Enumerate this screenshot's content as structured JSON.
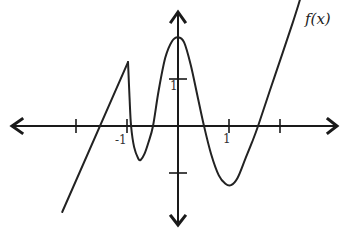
{
  "chart_data": {
    "type": "line",
    "title": "",
    "xlabel": "",
    "ylabel": "",
    "function_label": "f(x)",
    "xlim": [
      -3.3,
      3.1
    ],
    "ylim": [
      -2.1,
      2.5
    ],
    "grid": false,
    "x_ticks": [
      -2,
      -1,
      1,
      2
    ],
    "y_ticks": [
      -1,
      1
    ],
    "x_tick_labels": [
      {
        "value": -1,
        "text": "-1"
      },
      {
        "value": 1,
        "text": "1"
      }
    ],
    "y_tick_labels": [
      {
        "value": 1,
        "text": "1"
      }
    ],
    "series": [
      {
        "name": "f(x)",
        "segments": [
          {
            "kind": "line",
            "points": [
              [
                -2.27,
                -1.83
              ],
              [
                -0.98,
                1.36
              ]
            ]
          },
          {
            "kind": "curve",
            "points": [
              [
                -0.98,
                1.36
              ],
              [
                -0.95,
                0.6
              ],
              [
                -0.92,
                0.0
              ],
              [
                -0.86,
                -0.45
              ],
              [
                -0.78,
                -0.69
              ],
              [
                -0.73,
                -0.72
              ],
              [
                -0.66,
                -0.6
              ],
              [
                -0.58,
                -0.35
              ],
              [
                -0.49,
                0.0
              ],
              [
                -0.38,
                0.75
              ],
              [
                -0.25,
                1.45
              ],
              [
                -0.12,
                1.8
              ],
              [
                0.0,
                1.89
              ],
              [
                0.12,
                1.78
              ],
              [
                0.25,
                1.3
              ],
              [
                0.38,
                0.65
              ],
              [
                0.51,
                0.0
              ],
              [
                0.65,
                -0.6
              ],
              [
                0.8,
                -1.05
              ],
              [
                0.93,
                -1.23
              ],
              [
                1.04,
                -1.26
              ],
              [
                1.17,
                -1.1
              ],
              [
                1.32,
                -0.7
              ],
              [
                1.45,
                -0.35
              ],
              [
                1.57,
                0.0
              ],
              [
                1.8,
                0.75
              ],
              [
                2.05,
                1.55
              ],
              [
                2.25,
                2.2
              ],
              [
                2.39,
                2.68
              ]
            ]
          }
        ]
      }
    ],
    "color": "#222222",
    "axis_color": "#1a1a1a"
  }
}
